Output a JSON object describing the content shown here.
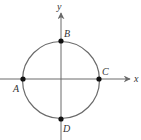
{
  "diagram": {
    "type": "unit-circle-coordinate-plane",
    "colors": {
      "axis": "#6a6a6a",
      "circle": "#6a6a6a",
      "point": "#111111",
      "label": "#333333",
      "background": "#ffffff"
    },
    "axes": {
      "x_label": "x",
      "y_label": "y"
    },
    "circle": {
      "center": [
        61,
        79
      ],
      "radius": 38
    },
    "points": [
      {
        "label": "A",
        "position": "left",
        "cx": 23,
        "cy": 79
      },
      {
        "label": "B",
        "position": "top",
        "cx": 61,
        "cy": 41
      },
      {
        "label": "C",
        "position": "right",
        "cx": 99,
        "cy": 79
      },
      {
        "label": "D",
        "position": "bottom",
        "cx": 61,
        "cy": 119
      }
    ]
  }
}
